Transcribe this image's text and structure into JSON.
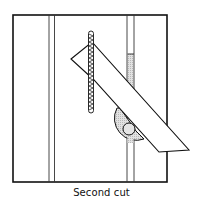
{
  "figure": {
    "caption": "Second cut",
    "colors": {
      "line": "#111111",
      "shading": "#d8d8d8",
      "background": "#ffffff"
    }
  },
  "diagram_parts": [
    {
      "id": "workpiece-frame",
      "label": "Workpiece / board outline"
    },
    {
      "id": "left-guide-groove",
      "label": "Left groove (two parallel lines)"
    },
    {
      "id": "right-guide-groove",
      "label": "Right groove with shaded section"
    },
    {
      "id": "saw-blade",
      "label": "Saw blade (vertical, toothed)"
    },
    {
      "id": "angled-fence",
      "label": "Angled fence bar"
    },
    {
      "id": "miter-gauge",
      "label": "Semicircular miter gauge with pivot"
    }
  ]
}
